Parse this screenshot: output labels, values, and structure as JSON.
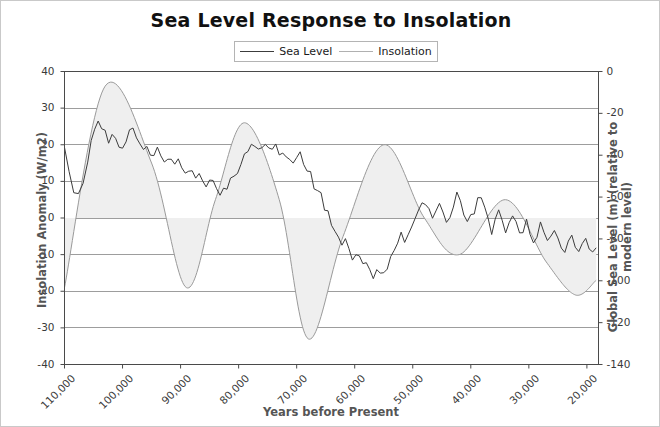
{
  "chart_data": {
    "type": "line",
    "title": "Sea Level Response to Insolation",
    "xlabel": "Years before Present",
    "ylabel": "Insolation Anomaly (W/m2)",
    "ylabel_right": "Global Sea Level (m) (relative to modern level)",
    "grid": true,
    "legend_position": "top-center",
    "xlim": [
      110000,
      18000
    ],
    "x_inverted": true,
    "xticks": [
      110000,
      100000,
      90000,
      80000,
      70000,
      60000,
      50000,
      40000,
      30000,
      20000
    ],
    "xticklabels": [
      "110,000",
      "100,000",
      "90,000",
      "80,000",
      "70,000",
      "60,000",
      "50,000",
      "40,000",
      "30,000",
      "20,000"
    ],
    "ylim": [
      -40,
      40
    ],
    "yticks": [
      -40,
      -30,
      -20,
      -10,
      0,
      10,
      20,
      30,
      40
    ],
    "yticklabels": [
      "-40",
      "-30",
      "-20",
      "-10",
      "0",
      "10",
      "20",
      "30",
      "40"
    ],
    "ylim_right": [
      -140,
      0
    ],
    "yticks_right": [
      -140,
      -120,
      -100,
      -80,
      -60,
      -40,
      -20,
      0
    ],
    "yticklabels_right": [
      "-140",
      "-120",
      "-100",
      "-80",
      "-60",
      "-40",
      "-20",
      "0"
    ],
    "colors": {
      "sea_level": "#3c3c3c",
      "insolation": "#9a9a9a",
      "insolation_fill": "#efefef",
      "grid": "#8c8c8c",
      "frame": "#4a4a4a"
    },
    "series": [
      {
        "name": "Sea Level",
        "axis": "right",
        "unit": "m",
        "color": "#3c3c3c",
        "x": [
          110000,
          109200,
          108400,
          107600,
          106800,
          106000,
          105400,
          104800,
          104200,
          103600,
          103000,
          102400,
          101800,
          101200,
          100600,
          100000,
          99400,
          98800,
          98200,
          97600,
          97000,
          96400,
          95800,
          95200,
          94600,
          94000,
          93400,
          92800,
          92200,
          91600,
          91000,
          90400,
          89800,
          89200,
          88600,
          88000,
          87400,
          86800,
          86200,
          85600,
          85000,
          84400,
          83800,
          83200,
          82600,
          82000,
          81400,
          80800,
          80200,
          79600,
          79000,
          78400,
          77800,
          77200,
          76600,
          76000,
          75400,
          74800,
          74200,
          73600,
          73000,
          72400,
          71800,
          71200,
          70600,
          70000,
          69400,
          68800,
          68200,
          67600,
          67000,
          66400,
          65800,
          65200,
          64600,
          64000,
          63400,
          62800,
          62200,
          61600,
          61000,
          60400,
          59800,
          59200,
          58600,
          58000,
          57400,
          56800,
          56200,
          55600,
          55000,
          54400,
          53800,
          53200,
          52600,
          52000,
          51400,
          50800,
          50200,
          49600,
          49000,
          48400,
          47800,
          47200,
          46600,
          46000,
          45400,
          44800,
          44200,
          43600,
          43000,
          42400,
          41800,
          41200,
          40600,
          40000,
          39400,
          38800,
          38200,
          37600,
          37000,
          36400,
          35800,
          35200,
          34600,
          34000,
          33400,
          32800,
          32200,
          31600,
          31000,
          30400,
          29800,
          29200,
          28600,
          28000,
          27400,
          26800,
          26200,
          25600,
          25000,
          24400,
          23800,
          23200,
          22600,
          22000,
          21400,
          20800,
          20200,
          19600,
          19000,
          18400
        ],
        "values": [
          -38,
          -48,
          -56,
          -60,
          -52,
          -42,
          -33,
          -28,
          -25,
          -27,
          -30,
          -33,
          -29,
          -31,
          -35,
          -38,
          -33,
          -26,
          -28,
          -34,
          -36,
          -35,
          -37,
          -38,
          -39,
          -38,
          -40,
          -41,
          -40,
          -42,
          -44,
          -43,
          -45,
          -47,
          -46,
          -48,
          -50,
          -49,
          -51,
          -53,
          -52,
          -54,
          -56,
          -58,
          -57,
          -55,
          -53,
          -50,
          -47,
          -44,
          -40,
          -37,
          -35,
          -34,
          -36,
          -35,
          -33,
          -35,
          -37,
          -36,
          -38,
          -40,
          -39,
          -41,
          -43,
          -42,
          -40,
          -43,
          -46,
          -50,
          -54,
          -57,
          -60,
          -64,
          -68,
          -72,
          -75,
          -79,
          -83,
          -80,
          -84,
          -88,
          -86,
          -90,
          -93,
          -91,
          -94,
          -97,
          -95,
          -98,
          -96,
          -93,
          -90,
          -86,
          -82,
          -79,
          -83,
          -80,
          -76,
          -72,
          -68,
          -65,
          -62,
          -66,
          -70,
          -67,
          -63,
          -68,
          -72,
          -69,
          -64,
          -58,
          -62,
          -68,
          -72,
          -70,
          -66,
          -62,
          -60,
          -64,
          -70,
          -76,
          -72,
          -68,
          -72,
          -76,
          -74,
          -70,
          -74,
          -78,
          -76,
          -72,
          -76,
          -80,
          -78,
          -74,
          -78,
          -82,
          -80,
          -76,
          -79,
          -83,
          -88,
          -82,
          -78,
          -82,
          -86,
          -84,
          -80,
          -84,
          -88,
          -86
        ],
        "values_note": "Sea level reconstruction, high-frequency millennial variability; drops to glacial minimum near -125 m around 20,000 BP"
      },
      {
        "name": "Insolation",
        "axis": "left",
        "unit": "W/m2",
        "color": "#9a9a9a",
        "filled": true,
        "fill_baseline": 0,
        "key_points": [
          {
            "x": 110000,
            "y": -19
          },
          {
            "x": 103000,
            "y": 36
          },
          {
            "x": 95000,
            "y": 15
          },
          {
            "x": 89000,
            "y": -19
          },
          {
            "x": 84000,
            "y": 5
          },
          {
            "x": 79000,
            "y": 26
          },
          {
            "x": 73000,
            "y": 5
          },
          {
            "x": 68000,
            "y": -33
          },
          {
            "x": 62000,
            "y": -5
          },
          {
            "x": 55000,
            "y": 20
          },
          {
            "x": 48000,
            "y": 0
          },
          {
            "x": 42000,
            "y": -10
          },
          {
            "x": 34000,
            "y": 5
          },
          {
            "x": 27000,
            "y": -12
          },
          {
            "x": 22000,
            "y": -21
          },
          {
            "x": 18400,
            "y": -17
          }
        ],
        "period_years": 21000,
        "description": "Quasi-sinusoidal precession-driven summer insolation anomaly oscillating between about +36 and -33 W/m2"
      }
    ]
  },
  "legend": {
    "entries": [
      {
        "label": "Sea Level",
        "color": "#3c3c3c"
      },
      {
        "label": "Insolation",
        "color": "#b0b0b0"
      }
    ]
  }
}
